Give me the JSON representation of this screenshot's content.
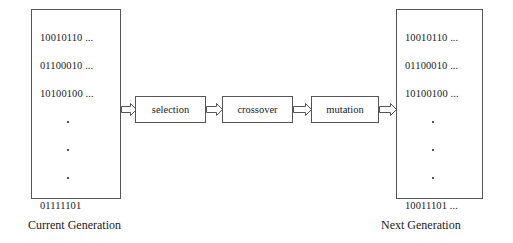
{
  "diagram": {
    "stroke_color": "#555555",
    "text_color": "#1a1a1a",
    "background_color": "#ffffff"
  },
  "current_generation": {
    "caption": "Current Generation",
    "chromosomes": [
      "10010110 ...",
      "01100010 ...",
      "10100100 ..."
    ],
    "ellipsis_marker": "·",
    "last_chromosome": "01111101"
  },
  "next_generation": {
    "caption": "Next Generation",
    "chromosomes": [
      "10010110 ...",
      "01100010 ...",
      "10100100 ..."
    ],
    "ellipsis_marker": "·",
    "last_chromosome": "10011101 ..."
  },
  "operators": [
    {
      "label": "selection"
    },
    {
      "label": "crossover"
    },
    {
      "label": "mutation"
    }
  ],
  "arrows": [
    {
      "name": "arrow-current-to-selection"
    },
    {
      "name": "arrow-selection-to-crossover"
    },
    {
      "name": "arrow-crossover-to-mutation"
    },
    {
      "name": "arrow-mutation-to-next"
    }
  ]
}
